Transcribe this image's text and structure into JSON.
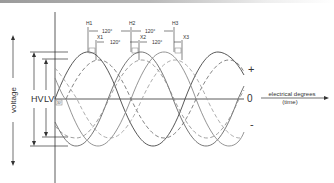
{
  "diagram": {
    "y_axis_label": "voltage",
    "magnitude_labels": {
      "hv": "HV",
      "lv": "LV"
    },
    "sign_labels": {
      "plus": "+",
      "zero": "0",
      "minus": "-"
    },
    "x_axis_label": {
      "line1": "electrical degrees",
      "line2": "(time)"
    },
    "phase_markers": {
      "hv": [
        "H1",
        "H2",
        "H3"
      ],
      "lv": [
        "X1",
        "X2",
        "X3"
      ],
      "hv_spacing": [
        "120°",
        "120°"
      ],
      "lv_spacing": [
        "120°",
        "120°"
      ],
      "displacement": "30°"
    },
    "series": [
      {
        "name": "HV phases",
        "style": "solid",
        "count": 3,
        "amplitude": "larger"
      },
      {
        "name": "LV phases",
        "style": "dashed",
        "count": 3,
        "amplitude": "smaller"
      }
    ],
    "colors": {
      "line": "#555555",
      "axis": "#333333",
      "text": "#333333"
    }
  }
}
